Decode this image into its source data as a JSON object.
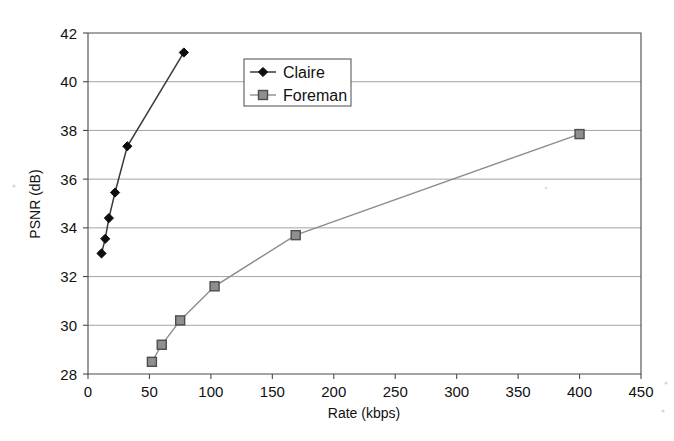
{
  "chart_data": {
    "type": "line",
    "title": "",
    "subtitle": "",
    "xlabel": "Rate (kbps)",
    "ylabel": "PSNR (dB)",
    "xlim": [
      0,
      450
    ],
    "ylim": [
      28,
      42
    ],
    "xticks": [
      0,
      50,
      100,
      150,
      200,
      250,
      300,
      350,
      400,
      450
    ],
    "yticks": [
      28,
      30,
      32,
      34,
      36,
      38,
      40,
      42
    ],
    "xtick_labels": [
      "0",
      "50",
      "100",
      "150",
      "200",
      "250",
      "300",
      "350",
      "400",
      "450"
    ],
    "ytick_labels": [
      "28",
      "30",
      "32",
      "34",
      "36",
      "38",
      "40",
      "42"
    ],
    "grid": "horizontal",
    "legend_position": "upper-center-left",
    "series": [
      {
        "name": "Claire",
        "marker": "diamond",
        "color": "#0d0d0d",
        "line_color": "#3a3a3a",
        "x": [
          11,
          14,
          17,
          22,
          32,
          78
        ],
        "y": [
          32.95,
          33.55,
          34.4,
          35.45,
          37.35,
          41.2
        ]
      },
      {
        "name": "Foreman",
        "marker": "square",
        "color": "#8f8f8f",
        "line_color": "#8c8c8c",
        "x": [
          52,
          60,
          75,
          103,
          169,
          400
        ],
        "y": [
          28.5,
          29.2,
          30.2,
          31.6,
          33.7,
          37.85
        ]
      }
    ]
  },
  "legend": {
    "entries": [
      {
        "label": "Claire"
      },
      {
        "label": "Foreman"
      }
    ]
  },
  "axes": {
    "x_title": "Rate (kbps)",
    "y_title": "PSNR (dB)"
  }
}
